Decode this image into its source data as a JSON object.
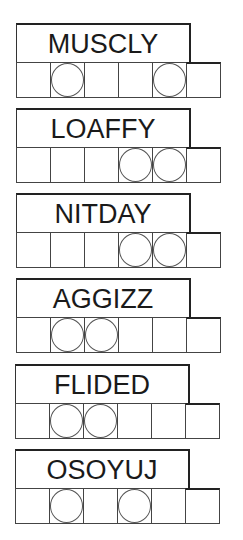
{
  "puzzles": [
    {
      "word": "MUSCLY",
      "circled": [
        1,
        4
      ]
    },
    {
      "word": "LOAFFY",
      "circled": [
        3,
        4
      ]
    },
    {
      "word": "NITDAY",
      "circled": [
        3,
        4
      ]
    },
    {
      "word": "AGGIZZ",
      "circled": [
        1,
        2
      ]
    },
    {
      "word": "FLIDED",
      "circled": [
        1,
        2
      ]
    },
    {
      "word": "OSOYUJ",
      "circled": [
        1,
        3
      ]
    }
  ],
  "cells_per_word": 6
}
